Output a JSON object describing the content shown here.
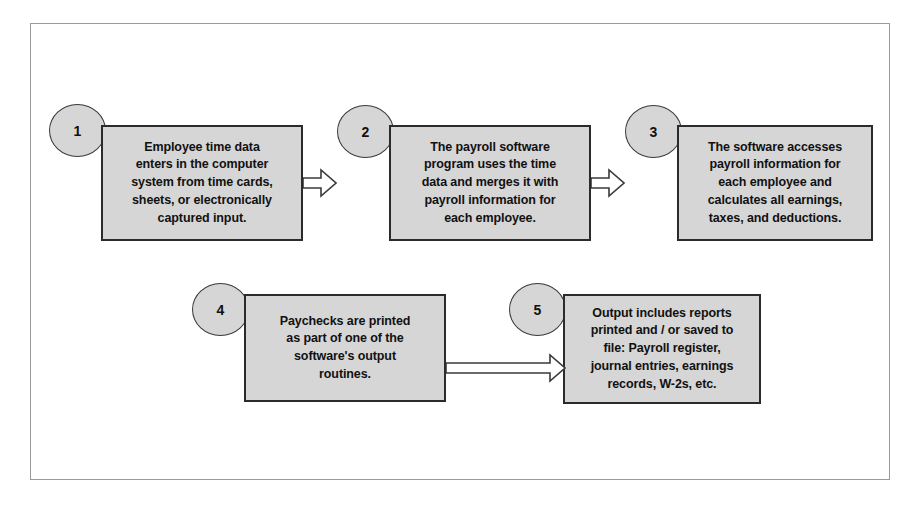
{
  "diagram": {
    "frame": {
      "border_color": "#9a9a9a"
    },
    "style": {
      "box_fill": "#d6d6d6",
      "box_border": "#2b2b2b",
      "circle_fill": "#d6d6d6",
      "circle_border": "#3a3a3a",
      "arrow_fill": "#ffffff",
      "arrow_border": "#3a3a3a",
      "text_color": "#111111",
      "background": "#ffffff"
    },
    "steps": [
      {
        "number": "1",
        "text": "Employee time data\nenters in the computer\nsystem from time cards,\nsheets, or electronically\ncaptured input."
      },
      {
        "number": "2",
        "text": "The payroll software\nprogram uses the time\ndata and merges it with\npayroll information for\neach employee."
      },
      {
        "number": "3",
        "text": "The software accesses\npayroll information for\neach employee and\ncalculates all earnings,\ntaxes, and deductions."
      },
      {
        "number": "4",
        "text": "Paychecks are printed\nas part of one of the\nsoftware's output\nroutines."
      },
      {
        "number": "5",
        "text": "Output includes reports\nprinted and / or saved to\nfile:  Payroll register,\njournal entries, earnings\nrecords, W-2s, etc."
      }
    ],
    "connectors": [
      {
        "from": "1",
        "to": "2",
        "kind": "block-arrow-right"
      },
      {
        "from": "2",
        "to": "3",
        "kind": "block-arrow-right"
      },
      {
        "from": "3",
        "to": "4",
        "kind": "implied-wrap"
      },
      {
        "from": "4",
        "to": "5",
        "kind": "block-arrow-right"
      }
    ]
  }
}
